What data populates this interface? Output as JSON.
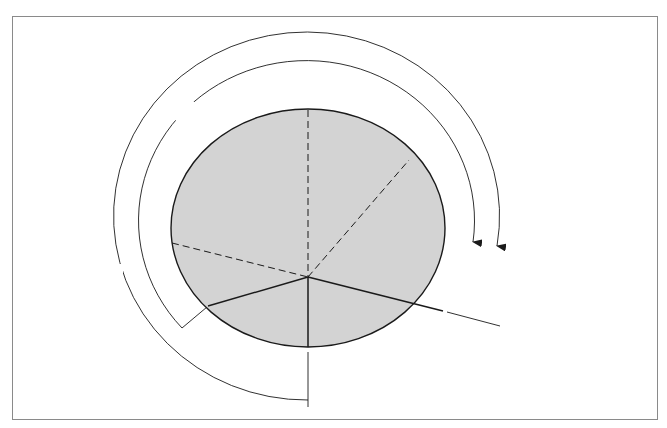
{
  "diagram": {
    "center_label": "NP",
    "greenwich_upper": {
      "line1": "GREENWICH",
      "line2": "UPPER BRANCH"
    },
    "greenwich_lower": {
      "line1": "GREENWICH",
      "line2": "LOWER BRANCH"
    },
    "observer_lower": {
      "line1": "OBSERVER'S",
      "line2": "LOWER BRANCH"
    },
    "mean_sun_upper": {
      "line1": "UPPER BRANCH",
      "line2": "OF MEAN SUN"
    },
    "arcs": {
      "outer": "GMT",
      "inner": "LMT"
    },
    "sun": {
      "line1": "MEAN",
      "line2": "SUN"
    },
    "colors": {
      "disc_fill": "#d2d2d2",
      "stroke": "#1a1a1a",
      "frame": "#8a8a8a"
    }
  }
}
